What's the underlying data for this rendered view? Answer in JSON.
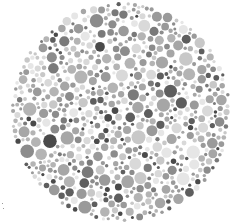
{
  "image": {
    "description": "Grayscale dot-pattern plate (Ishihara-style color vision test)",
    "width": 242,
    "height": 224,
    "background": "#ffffff"
  },
  "plate": {
    "center_x": 121,
    "center_y": 112,
    "radius": 110,
    "dot_radius_min": 1.5,
    "dot_radius_max": 7,
    "palette": [
      "#e6e6e6",
      "#d9d9d9",
      "#c8c8c8",
      "#b4b4b4",
      "#a6a6a6",
      "#9a9a9a",
      "#8c8c8c",
      "#7a7a7a",
      "#5e5e5e",
      "#4a4a4a"
    ],
    "palette_weights": [
      10,
      10,
      12,
      14,
      14,
      12,
      8,
      6,
      6,
      5
    ],
    "seed": 7
  },
  "specks": [
    {
      "x": 2,
      "y": 203
    },
    {
      "x": 3,
      "y": 208
    }
  ]
}
